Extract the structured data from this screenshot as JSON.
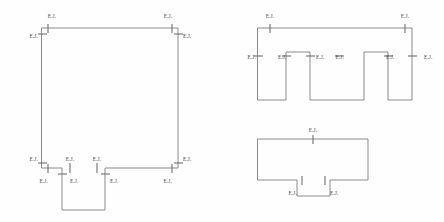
{
  "sheet": {
    "title": "Expansion Joint Location Plans",
    "background_color": "#fefefe",
    "line_color": "#8a8a8a",
    "tick_color": "#6f6f6f",
    "label_color": "#4a4a4a",
    "label_text": "E.J.",
    "label_meaning": "Expansion Joint"
  },
  "figures": [
    {
      "id": "figure-left",
      "name": "square-plan-with-bottom-projection",
      "shape": "rectangle with a rectangular projection extending downward from the bottom edge",
      "joint_count": 13
    },
    {
      "id": "figure-top-right",
      "name": "castellated-comb-plan",
      "shape": "comb / castellated plan with three downward legs separated by two upward notches",
      "joint_count": 8
    },
    {
      "id": "figure-bottom-right",
      "name": "rectangle-plan-with-bottom-notch",
      "shape": "rectangle with a small rectangular projection at the bottom center",
      "joint_count": 3
    }
  ],
  "labels": {
    "left": [
      {
        "id": "l1",
        "text": "E.J.",
        "x": 52,
        "y": 13,
        "align": "c"
      },
      {
        "id": "l2",
        "text": "E.J.",
        "x": 38,
        "y": 33,
        "align": "r"
      },
      {
        "id": "l3",
        "text": "E.J.",
        "x": 168,
        "y": 13,
        "align": "c"
      },
      {
        "id": "l4",
        "text": "E.J.",
        "x": 183,
        "y": 33,
        "align": "l"
      },
      {
        "id": "l5",
        "text": "E.J.",
        "x": 38,
        "y": 156,
        "align": "r"
      },
      {
        "id": "l6",
        "text": "E.J.",
        "x": 48,
        "y": 178,
        "align": "r"
      },
      {
        "id": "l7",
        "text": "E.J.",
        "x": 70,
        "y": 156,
        "align": "c"
      },
      {
        "id": "l8",
        "text": "E.J.",
        "x": 70,
        "y": 178,
        "align": "l"
      },
      {
        "id": "l9",
        "text": "E.J.",
        "x": 97,
        "y": 156,
        "align": "c"
      },
      {
        "id": "l10",
        "text": "E.J.",
        "x": 110,
        "y": 178,
        "align": "l"
      },
      {
        "id": "l11",
        "text": "E.J.",
        "x": 183,
        "y": 156,
        "align": "l"
      },
      {
        "id": "l12",
        "text": "E.J.",
        "x": 172,
        "y": 178,
        "align": "r"
      }
    ],
    "top_right": [
      {
        "id": "t1",
        "text": "E.J.",
        "x": 270,
        "y": 13,
        "align": "c"
      },
      {
        "id": "t2",
        "text": "E.J.",
        "x": 405,
        "y": 13,
        "align": "c"
      },
      {
        "id": "t3",
        "text": "E.J.",
        "x": 256,
        "y": 54,
        "align": "r"
      },
      {
        "id": "t4",
        "text": "E.J.",
        "x": 278,
        "y": 54,
        "align": "l"
      },
      {
        "id": "t5",
        "text": "E.J.",
        "x": 316,
        "y": 54,
        "align": "l"
      },
      {
        "id": "t6",
        "text": "E.J.",
        "x": 344,
        "y": 54,
        "align": "r"
      },
      {
        "id": "t7",
        "text": "E.J.",
        "x": 386,
        "y": 54,
        "align": "l"
      },
      {
        "id": "t8",
        "text": "E.J.",
        "x": 424,
        "y": 54,
        "align": "l"
      }
    ],
    "bottom_right": [
      {
        "id": "b1",
        "text": "E.J.",
        "x": 313,
        "y": 127,
        "align": "c"
      },
      {
        "id": "b2",
        "text": "E.J.",
        "x": 297,
        "y": 190,
        "align": "r"
      },
      {
        "id": "b3",
        "text": "E.J.",
        "x": 330,
        "y": 190,
        "align": "l"
      }
    ]
  },
  "geometry": {
    "left_outline": "M42,28 L178,28 L178,168 L105,168 L105,210 L62,210 L62,168 L42,168 Z",
    "top_right_outline": "M258,28 L412,28 L412,100 L388,100 L388,52 L364,52 L364,100 L310,100 L310,52 L286,52 L286,100 L258,100 Z",
    "bottom_right_outline": "M258,139 L368,139 L368,180 L330,180 L330,196 L297,196 L297,180 L258,180 Z",
    "left_ticks": [
      {
        "x1": 48,
        "y1": 24,
        "x2": 48,
        "y2": 33
      },
      {
        "x1": 38,
        "y1": 34,
        "x2": 47,
        "y2": 34
      },
      {
        "x1": 172,
        "y1": 24,
        "x2": 172,
        "y2": 33
      },
      {
        "x1": 174,
        "y1": 34,
        "x2": 183,
        "y2": 34
      },
      {
        "x1": 38,
        "y1": 163,
        "x2": 47,
        "y2": 163
      },
      {
        "x1": 48,
        "y1": 164,
        "x2": 48,
        "y2": 173
      },
      {
        "x1": 70,
        "y1": 163,
        "x2": 70,
        "y2": 173
      },
      {
        "x1": 58,
        "y1": 174,
        "x2": 67,
        "y2": 174
      },
      {
        "x1": 97,
        "y1": 163,
        "x2": 97,
        "y2": 173
      },
      {
        "x1": 101,
        "y1": 174,
        "x2": 110,
        "y2": 174
      },
      {
        "x1": 174,
        "y1": 163,
        "x2": 183,
        "y2": 163
      },
      {
        "x1": 172,
        "y1": 164,
        "x2": 172,
        "y2": 173
      }
    ],
    "top_right_ticks": [
      {
        "x1": 270,
        "y1": 24,
        "x2": 270,
        "y2": 33
      },
      {
        "x1": 405,
        "y1": 24,
        "x2": 405,
        "y2": 33
      },
      {
        "x1": 254,
        "y1": 56,
        "x2": 263,
        "y2": 56
      },
      {
        "x1": 282,
        "y1": 56,
        "x2": 291,
        "y2": 56
      },
      {
        "x1": 306,
        "y1": 56,
        "x2": 315,
        "y2": 56
      },
      {
        "x1": 335,
        "y1": 56,
        "x2": 344,
        "y2": 56
      },
      {
        "x1": 384,
        "y1": 56,
        "x2": 393,
        "y2": 56
      },
      {
        "x1": 408,
        "y1": 56,
        "x2": 417,
        "y2": 56
      }
    ],
    "bottom_right_ticks": [
      {
        "x1": 313,
        "y1": 135,
        "x2": 313,
        "y2": 144
      },
      {
        "x1": 302,
        "y1": 176,
        "x2": 302,
        "y2": 185
      },
      {
        "x1": 325,
        "y1": 176,
        "x2": 325,
        "y2": 185
      }
    ]
  }
}
